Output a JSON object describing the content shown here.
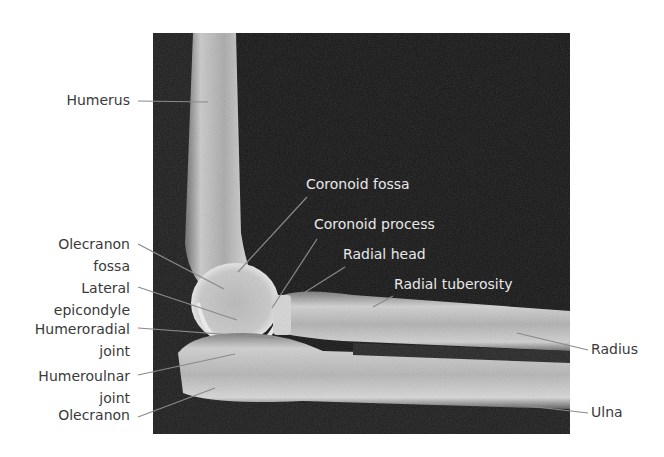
{
  "figure": {
    "colors": {
      "background": "#ffffff",
      "xray_dark": "#141414",
      "bone_light": "#d8d8d8",
      "label_outside": "#3a3a3a",
      "label_inside": "#e8e8e8",
      "leader_line": "#8a8a8a"
    }
  },
  "labels_left": [
    {
      "id": "humerus",
      "text": "Humerus"
    },
    {
      "id": "olecranon-fossa",
      "line1": "Olecranon",
      "line2": "fossa"
    },
    {
      "id": "lateral-epicondyle",
      "line1": "Lateral",
      "line2": "epicondyle"
    },
    {
      "id": "humeroradial-joint",
      "line1": "Humeroradial",
      "line2": "joint"
    },
    {
      "id": "humeroulnar-joint",
      "line1": "Humeroulnar",
      "line2": "joint"
    },
    {
      "id": "olecranon",
      "text": "Olecranon"
    }
  ],
  "labels_inside": [
    {
      "id": "coronoid-fossa",
      "text": "Coronoid fossa"
    },
    {
      "id": "coronoid-process",
      "text": "Coronoid process"
    },
    {
      "id": "radial-head",
      "text": "Radial head"
    },
    {
      "id": "radial-tuberosity",
      "text": "Radial tuberosity"
    }
  ],
  "labels_right": [
    {
      "id": "radius",
      "text": "Radius"
    },
    {
      "id": "ulna",
      "text": "Ulna"
    }
  ]
}
